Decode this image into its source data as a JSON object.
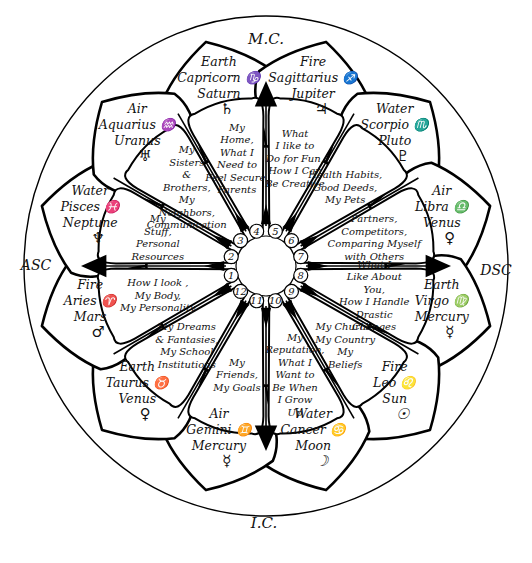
{
  "diagram": {
    "angles": {
      "mc": "M.C.",
      "ic": "I.C.",
      "asc": "ASC",
      "dsc": "DSC"
    },
    "signs": [
      {
        "id": "capricorn",
        "element": "Earth",
        "sign": "Capricorn",
        "sign_glyph": "♑",
        "ruler": "Saturn",
        "ruler_glyph": "♄"
      },
      {
        "id": "sagittarius",
        "element": "Fire",
        "sign": "Sagittarius",
        "sign_glyph": "♐",
        "ruler": "Jupiter",
        "ruler_glyph": "♃"
      },
      {
        "id": "scorpio",
        "element": "Water",
        "sign": "Scorpio",
        "sign_glyph": "♏",
        "ruler": "Pluto",
        "ruler_glyph": "♇"
      },
      {
        "id": "libra",
        "element": "Air",
        "sign": "Libra",
        "sign_glyph": "♎",
        "ruler": "Venus",
        "ruler_glyph": "♀"
      },
      {
        "id": "virgo",
        "element": "Earth",
        "sign": "Virgo",
        "sign_glyph": "♍",
        "ruler": "Mercury",
        "ruler_glyph": "☿"
      },
      {
        "id": "leo",
        "element": "Fire",
        "sign": "Leo",
        "sign_glyph": "♌",
        "ruler": "Sun",
        "ruler_glyph": "☉"
      },
      {
        "id": "cancer",
        "element": "Water",
        "sign": "Cancer",
        "sign_glyph": "♋",
        "ruler": "Moon",
        "ruler_glyph": "☽"
      },
      {
        "id": "gemini",
        "element": "Air",
        "sign": "Gemini",
        "sign_glyph": "♊",
        "ruler": "Mercury",
        "ruler_glyph": "☿"
      },
      {
        "id": "taurus",
        "element": "Earth",
        "sign": "Taurus",
        "sign_glyph": "♉",
        "ruler": "Venus",
        "ruler_glyph": "♀"
      },
      {
        "id": "aries",
        "element": "Fire",
        "sign": "Aries",
        "sign_glyph": "♈",
        "ruler": "Mars",
        "ruler_glyph": "♂"
      },
      {
        "id": "pisces",
        "element": "Water",
        "sign": "Pisces",
        "sign_glyph": "♓",
        "ruler": "Neptune",
        "ruler_glyph": "♆"
      },
      {
        "id": "aquarius",
        "element": "Air",
        "sign": "Aquarius",
        "sign_glyph": "♒",
        "ruler": "Uranus",
        "ruler_glyph": "♅"
      }
    ],
    "houses": [
      {
        "number": "1",
        "lines": [
          "How I look ,",
          "My Body,",
          "My Personality"
        ]
      },
      {
        "number": "2",
        "lines": [
          "My",
          "Stuff,",
          "Personal",
          "Resources"
        ]
      },
      {
        "number": "3",
        "lines": [
          "My",
          "Sisters",
          "&",
          "Brothers,",
          "My",
          "Neighbors,",
          "Communication"
        ]
      },
      {
        "number": "4",
        "lines": [
          "My",
          "Home,",
          "What I",
          "Need to",
          "Feel Secure,",
          "Parents"
        ]
      },
      {
        "number": "5",
        "lines": [
          "What",
          "I like to",
          "Do for Fun,",
          "How I Can",
          "Be Creative"
        ]
      },
      {
        "number": "6",
        "lines": [
          "Health Habits,",
          "Good Deeds,",
          "My Pets"
        ]
      },
      {
        "number": "7",
        "lines": [
          "Partners,",
          "Competitors,",
          "Comparing Myself",
          "with Others"
        ]
      },
      {
        "number": "8",
        "lines": [
          "What I",
          "Like About",
          "You,",
          "How I Handle",
          "Drastic",
          "Changes"
        ]
      },
      {
        "number": "9",
        "lines": [
          "My Church,",
          "My Country",
          "My",
          "Beliefs"
        ]
      },
      {
        "number": "10",
        "lines": [
          "My",
          "Reputation,",
          "What I",
          "Want to",
          "Be When",
          "I Grow",
          "Up"
        ]
      },
      {
        "number": "11",
        "lines": [
          "My",
          "Friends,",
          "My Goals"
        ]
      },
      {
        "number": "12",
        "lines": [
          "My Dreams",
          "& Fantasies,",
          "My School",
          "Institutions"
        ]
      }
    ]
  }
}
